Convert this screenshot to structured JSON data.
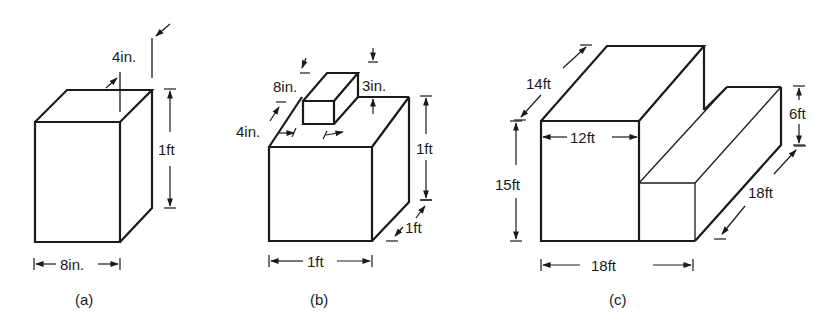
{
  "figure": {
    "panels": [
      {
        "id": "a",
        "caption": "(a)",
        "labels": {
          "width": "8in.",
          "height": "1ft",
          "depth": "4in."
        }
      },
      {
        "id": "b",
        "caption": "(b)",
        "labels": {
          "base_width": "1ft",
          "base_height": "1ft",
          "base_depth": "1ft",
          "top_length": "8in.",
          "top_depth": "4in.",
          "top_height": "3in."
        }
      },
      {
        "id": "c",
        "caption": "(c)",
        "labels": {
          "width": "18ft",
          "height": "15ft",
          "depth": "14ft",
          "tall_width": "12ft",
          "low_height": "6ft",
          "low_depth": "18ft"
        }
      }
    ],
    "colors": {
      "ink": "#1a1a1a",
      "background": "#ffffff"
    }
  }
}
